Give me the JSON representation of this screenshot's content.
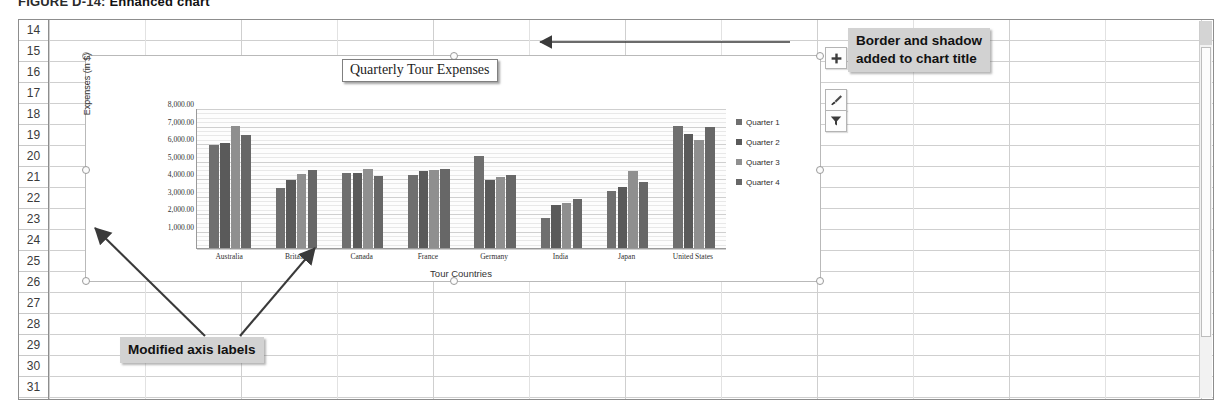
{
  "caption": {
    "figure": "FIGURE D-14:",
    "title": "Enhanced chart"
  },
  "worksheet": {
    "row_headers": [
      "14",
      "15",
      "16",
      "17",
      "18",
      "19",
      "20",
      "21",
      "22",
      "23",
      "24",
      "25",
      "26",
      "27",
      "28",
      "29",
      "30",
      "31"
    ],
    "scrollbar_name": "vertical-scrollbar"
  },
  "chart": {
    "title": "Quarterly Tour Expenses",
    "ytitle": "Expenses (in $)",
    "xtitle": "Tour Countries",
    "ylabels": [
      "8,000.00",
      "7,000.00",
      "6,000.00",
      "5,000.00",
      "4,000.00",
      "3,000.00",
      "2,000.00",
      "1,000.00"
    ],
    "legend": [
      "Quarter 1",
      "Quarter 2",
      "Quarter 3",
      "Quarter 4"
    ],
    "series_colors": [
      "#6f6f6f",
      "#5a5a5a",
      "#8f8f8f",
      "#676767"
    ],
    "buttons": [
      {
        "name": "chart-elements-button",
        "glyph": "+"
      },
      {
        "name": "chart-styles-button",
        "glyph": "brush"
      },
      {
        "name": "chart-filters-button",
        "glyph": "funnel"
      }
    ]
  },
  "callouts": {
    "border": {
      "line1": "Border and shadow",
      "line2": "added to chart title"
    },
    "axis": {
      "line1": "Modified axis labels"
    }
  },
  "chart_data": {
    "type": "bar",
    "title": "Quarterly Tour Expenses",
    "xlabel": "Tour Countries",
    "ylabel": "Expenses (in $)",
    "ylim": [
      0,
      8000
    ],
    "ytick_labels": [
      "1,000.00",
      "2,000.00",
      "3,000.00",
      "4,000.00",
      "5,000.00",
      "6,000.00",
      "7,000.00",
      "8,000.00"
    ],
    "grid": true,
    "legend_position": "right",
    "categories": [
      "Australia",
      "Britain",
      "Canada",
      "France",
      "Germany",
      "India",
      "Japan",
      "United States"
    ],
    "series": [
      {
        "name": "Quarter 1",
        "values": [
          5900,
          3450,
          4300,
          4150,
          5250,
          1700,
          3250,
          7000
        ]
      },
      {
        "name": "Quarter 2",
        "values": [
          6000,
          3900,
          4300,
          4400,
          3900,
          2450,
          3500,
          6500
        ]
      },
      {
        "name": "Quarter 3",
        "values": [
          7000,
          4250,
          4500,
          4450,
          4050,
          2600,
          4400,
          6200
        ]
      },
      {
        "name": "Quarter 4",
        "values": [
          6450,
          4450,
          4100,
          4500,
          4150,
          2800,
          3750,
          6900
        ]
      }
    ]
  }
}
